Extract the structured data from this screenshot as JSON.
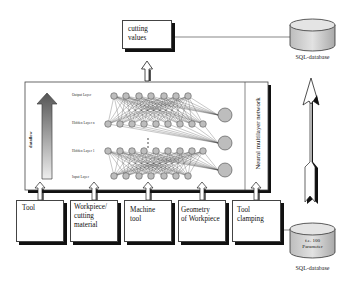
{
  "diagram": {
    "output_box": {
      "label_line1": "cutting",
      "label_line2": "values"
    },
    "top_database": {
      "label": "SQL-database"
    },
    "network": {
      "title": "Neural multilayer network",
      "dataflow_label": "dataflow",
      "layers": [
        {
          "name": "Output Layer"
        },
        {
          "name": "Hidden Layer n"
        },
        {
          "name": "Hidden Layer 1"
        },
        {
          "name": "Input Layer"
        }
      ]
    },
    "inputs": [
      {
        "line1": "Tool",
        "line2": "",
        "line3": ""
      },
      {
        "line1": "Workpiece/",
        "line2": "cutting",
        "line3": "material"
      },
      {
        "line1": "Machine",
        "line2": "tool",
        "line3": ""
      },
      {
        "line1": "Geometry",
        "line2": "of Workpiece",
        "line3": ""
      },
      {
        "line1": "Tool",
        "line2": "clamping",
        "line3": ""
      }
    ],
    "bottom_database": {
      "label_line1": "f.e. 100",
      "label_line2": "Parameter",
      "caption": "SQL-database"
    },
    "colors": {
      "stroke": "#222222",
      "shadow": "#111111",
      "node_fill": "#b8b8b8",
      "db_fill": "#cfcfcf"
    }
  }
}
